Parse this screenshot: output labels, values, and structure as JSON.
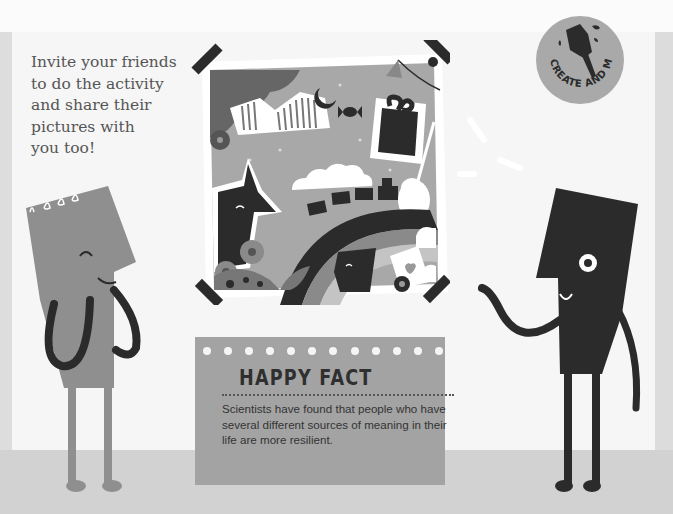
{
  "intro": {
    "lines": [
      "Invite your friends",
      "to do the activity",
      "and share their",
      "pictures with",
      "you too!"
    ]
  },
  "badge": {
    "label": "CREATE AND MAKE",
    "icon": "paintbrush-icon"
  },
  "photo": {
    "description": "Collage picture taped to wall: fox, rainbow, train, gift box, guitar, moon, candy, flowers, clouds, heart envelope",
    "tape_pieces": 4
  },
  "happy_fact": {
    "title": "HAPPY FACT",
    "body": "Scientists have found that people who have several different sources of meaning in their life are more resilient.",
    "dot_count": 12
  },
  "characters": [
    {
      "name": "left-character",
      "color": "#8f8f8f",
      "expression": "smiling, hands on cheeks"
    },
    {
      "name": "right-character",
      "color": "#2b2b2b",
      "expression": "smiling, waving"
    }
  ],
  "colors": {
    "panel": "#f6f6f6",
    "floor": "#d2d2d2",
    "card": "#a3a3a3",
    "dark": "#2b2b2b",
    "mid": "#8f8f8f"
  }
}
